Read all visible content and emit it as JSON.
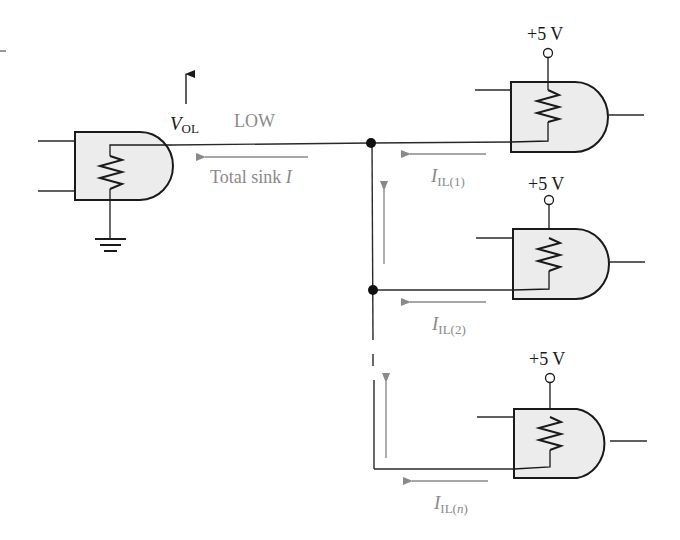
{
  "colors": {
    "wire": "#2a2a2a",
    "gate_fill": "#ececec",
    "gate_stroke": "#1a1a1a",
    "current_arrow": "#8a8a8a",
    "label_gray": "#8a8a8a",
    "label_dark": "#1a1a1a"
  },
  "driver": {
    "voltage_label_main": "V",
    "voltage_label_sub": "OL",
    "state_label": "LOW",
    "current_label_text": "Total sink ",
    "current_label_var": "I"
  },
  "loads": [
    {
      "supply": "+5 V",
      "current_main": "I",
      "current_sub": "IL(1)"
    },
    {
      "supply": "+5 V",
      "current_main": "I",
      "current_sub": "IL(2)"
    },
    {
      "supply": "+5 V",
      "current_main": "I",
      "current_sub_pre": "IL(",
      "current_sub_var": "n",
      "current_sub_post": ")"
    }
  ]
}
